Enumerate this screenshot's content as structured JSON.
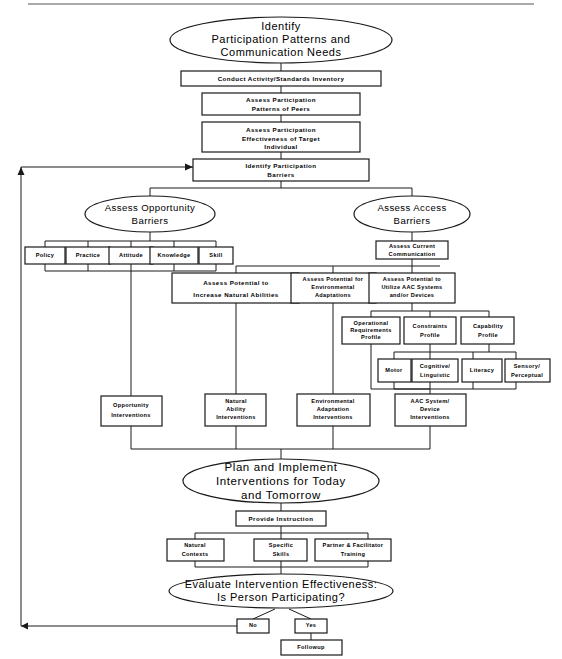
{
  "document": {
    "title": "Participation Model Flowchart",
    "top_rule": true
  },
  "colors": {
    "line": "#1a1a1a",
    "text": "#000000",
    "background": "#ffffff",
    "rule": "#555555"
  },
  "nodes": {
    "identify_participation": {
      "label_lines": [
        "Identify",
        "Participation Patterns and",
        "Communication Needs"
      ],
      "shape": "ellipse"
    },
    "conduct_inventory": {
      "label_lines": [
        "Conduct  Activity/Standards  Inventory"
      ],
      "shape": "box"
    },
    "assess_patterns_peers": {
      "label_lines": [
        "Assess  Participation",
        "Patterns  of  Peers"
      ],
      "shape": "box"
    },
    "assess_effectiveness": {
      "label_lines": [
        "Assess  Participation",
        "Effectiveness  of  Target",
        "Individual"
      ],
      "shape": "box"
    },
    "identify_barriers": {
      "label_lines": [
        "Identify  Participation",
        "Barriers"
      ],
      "shape": "box"
    },
    "assess_opportunity_barriers": {
      "label_lines": [
        "Assess Opportunity",
        "Barriers"
      ],
      "shape": "ellipse"
    },
    "assess_access_barriers": {
      "label_lines": [
        "Assess Access",
        "Barriers"
      ],
      "shape": "ellipse"
    },
    "policy": {
      "label_lines": [
        "Policy"
      ],
      "shape": "box"
    },
    "practice": {
      "label_lines": [
        "Practice"
      ],
      "shape": "box"
    },
    "attitude": {
      "label_lines": [
        "Attitude"
      ],
      "shape": "box"
    },
    "knowledge": {
      "label_lines": [
        "Knowledge"
      ],
      "shape": "box"
    },
    "skill": {
      "label_lines": [
        "Skill"
      ],
      "shape": "box"
    },
    "assess_current_communication": {
      "label_lines": [
        "Assess  Current",
        "Communication"
      ],
      "shape": "box"
    },
    "assess_increase_natural": {
      "label_lines": [
        "Assess  Potential  to",
        "Increase  Natural  Abilities"
      ],
      "shape": "box"
    },
    "assess_environmental": {
      "label_lines": [
        "Assess  Potential  for",
        "Environmental",
        "Adaptations"
      ],
      "shape": "box"
    },
    "assess_aac": {
      "label_lines": [
        "Assess  Potential  to",
        "Utilize  AAC  Systems",
        "and/or  Devices"
      ],
      "shape": "box"
    },
    "operational_requirements_profile": {
      "label_lines": [
        "Operational",
        "Requirements",
        "Profile"
      ],
      "shape": "box"
    },
    "constraints_profile": {
      "label_lines": [
        "Constraints",
        "Profile"
      ],
      "shape": "box"
    },
    "capability_profile": {
      "label_lines": [
        "Capability",
        "Profile"
      ],
      "shape": "box"
    },
    "motor": {
      "label_lines": [
        "Motor"
      ],
      "shape": "box"
    },
    "cognitive_linguistic": {
      "label_lines": [
        "Cognitive/",
        "Linguistic"
      ],
      "shape": "box"
    },
    "literacy": {
      "label_lines": [
        "Literacy"
      ],
      "shape": "box"
    },
    "sensory_perceptual": {
      "label_lines": [
        "Sensory/",
        "Perceptual"
      ],
      "shape": "box"
    },
    "opportunity_interventions": {
      "label_lines": [
        "Opportunity",
        "Interventions"
      ],
      "shape": "box"
    },
    "natural_ability_interventions": {
      "label_lines": [
        "Natural",
        "Ability",
        "Interventions"
      ],
      "shape": "box"
    },
    "environmental_adaptation_interventions": {
      "label_lines": [
        "Environmental",
        "Adaptation",
        "Interventions"
      ],
      "shape": "box"
    },
    "aac_system_device_interventions": {
      "label_lines": [
        "AAC  System/",
        "Device",
        "Interventions"
      ],
      "shape": "box"
    },
    "plan_and_implement": {
      "label_lines": [
        "Plan  and  Implement",
        "Interventions  for  Today",
        "and  Tomorrow"
      ],
      "shape": "ellipse"
    },
    "provide_instruction": {
      "label_lines": [
        "Provide  Instruction"
      ],
      "shape": "box"
    },
    "natural_contexts": {
      "label_lines": [
        "Natural",
        "Contexts"
      ],
      "shape": "box"
    },
    "specific_skills": {
      "label_lines": [
        "Specific",
        "Skills"
      ],
      "shape": "box"
    },
    "partner_facilitator_training": {
      "label_lines": [
        "Partner  &  Facilitator",
        "Training"
      ],
      "shape": "box"
    },
    "evaluate_effectiveness": {
      "label_lines": [
        "Evaluate  Intervention  Effectiveness:",
        "Is  Person  Participating?"
      ],
      "shape": "ellipse"
    },
    "no_branch": {
      "label_lines": [
        "No"
      ],
      "shape": "box"
    },
    "yes_branch": {
      "label_lines": [
        "Yes"
      ],
      "shape": "box"
    },
    "followup": {
      "label_lines": [
        "Followup"
      ],
      "shape": "box"
    }
  }
}
